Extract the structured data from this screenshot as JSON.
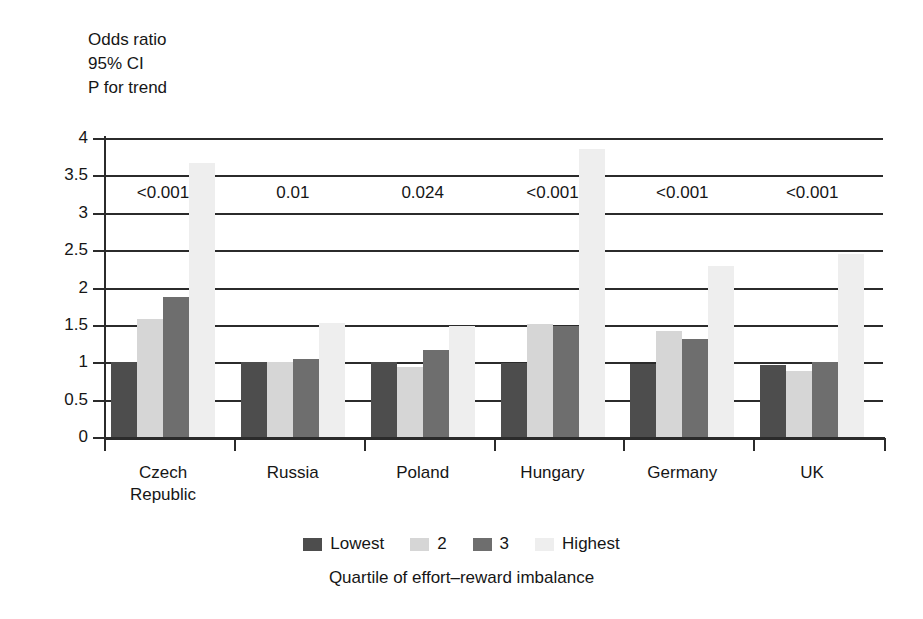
{
  "header_note": {
    "line1": "Odds ratio",
    "line2": "95% CI",
    "line3": "P for trend"
  },
  "chart_data": {
    "type": "bar",
    "title": "",
    "subtitle": "",
    "xlabel": "Quartile of effort–reward imbalance",
    "ylabel": "Odds ratio",
    "ylim": [
      0,
      4
    ],
    "grid": true,
    "legend_position": "bottom",
    "ytick_labels": [
      "0",
      "0.5",
      "1",
      "1.5",
      "2",
      "2.5",
      "3",
      "3.5",
      "4"
    ],
    "ytick_values": [
      0,
      0.5,
      1,
      1.5,
      2,
      2.5,
      3,
      3.5,
      4
    ],
    "categories": [
      "Czech Republic",
      "Russia",
      "Poland",
      "Hungary",
      "Germany",
      "UK"
    ],
    "category_lines": [
      [
        "Czech",
        "Republic"
      ],
      [
        "Russia"
      ],
      [
        "Poland"
      ],
      [
        "Hungary"
      ],
      [
        "Germany"
      ],
      [
        "UK"
      ]
    ],
    "series": [
      {
        "name": "Lowest",
        "color": "#4d4d4d",
        "values": [
          1.0,
          1.0,
          1.0,
          0.99,
          0.98,
          0.96
        ]
      },
      {
        "name": "2",
        "color": "#d6d6d6",
        "values": [
          1.58,
          1.0,
          0.93,
          1.51,
          1.42,
          0.88
        ]
      },
      {
        "name": "3",
        "color": "#6e6e6e",
        "values": [
          1.87,
          1.04,
          1.16,
          1.49,
          1.31,
          1.0
        ]
      },
      {
        "name": "Highest",
        "color": "#eeeeee",
        "values": [
          3.66,
          1.52,
          1.48,
          3.85,
          2.29,
          2.45
        ]
      }
    ],
    "annotations": {
      "label": "P for trend",
      "values": [
        "<0.001",
        "0.01",
        "0.024",
        "<0.001",
        "<0.001",
        "<0.001"
      ]
    }
  },
  "legend": {
    "items": [
      {
        "label": "Lowest",
        "color": "#4d4d4d"
      },
      {
        "label": "2",
        "color": "#d6d6d6"
      },
      {
        "label": "3",
        "color": "#6e6e6e"
      },
      {
        "label": "Highest",
        "color": "#eeeeee"
      }
    ]
  }
}
